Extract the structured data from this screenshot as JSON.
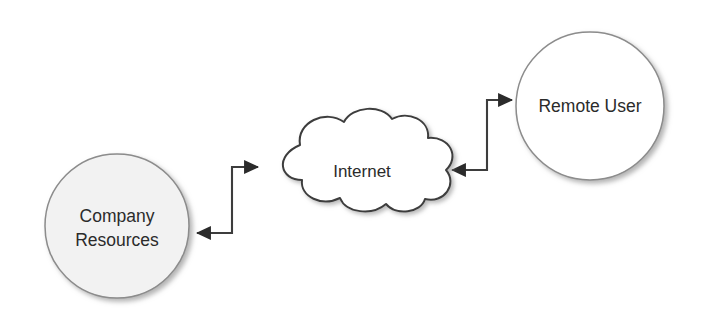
{
  "diagram": {
    "background_color": "#ffffff",
    "width": 702,
    "height": 330,
    "nodes": [
      {
        "id": "company-resources",
        "shape": "circle",
        "label_line1": "Company",
        "label_line2": "Resources",
        "fill_color": "#f2f2f2",
        "stroke_color": "#8c8c8c",
        "text_color": "#2b2b2b",
        "center_x": 117,
        "center_y": 226,
        "radius": 72
      },
      {
        "id": "internet",
        "shape": "cloud",
        "label_line1": "Internet",
        "fill_color": "#ffffff",
        "stroke_color": "#3d3d3d",
        "text_color": "#2b2b2b",
        "center_x": 362,
        "center_y": 170
      },
      {
        "id": "remote-user",
        "shape": "circle",
        "label_line1": "Remote User",
        "fill_color": "#ffffff",
        "stroke_color": "#8c8c8c",
        "text_color": "#2b2b2b",
        "center_x": 590,
        "center_y": 106,
        "radius": 74
      }
    ],
    "connectors": [
      {
        "id": "company-internet-link",
        "from": "company-resources",
        "to": "internet",
        "style": "elbow",
        "direction": "bidirectional",
        "color": "#3d3d3d",
        "arrow_to_target_y": 167,
        "arrow_to_source_y": 233
      },
      {
        "id": "internet-remote-link",
        "from": "internet",
        "to": "remote-user",
        "style": "elbow",
        "direction": "bidirectional",
        "color": "#3d3d3d",
        "arrow_to_target_y": 100,
        "arrow_to_source_y": 170
      }
    ]
  }
}
